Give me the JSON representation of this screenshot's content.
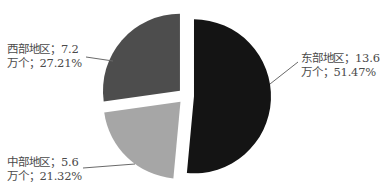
{
  "chart_data": {
    "type": "pie",
    "title": "",
    "exploded": true,
    "start_angle_deg": 0,
    "direction": "clockwise",
    "unit": "万个",
    "slices": [
      {
        "name": "东部地区",
        "value": 13.6,
        "percent": 51.47,
        "color": "#141414",
        "label_line1": "东部地区；13.6",
        "label_line2": "万个；51.47%"
      },
      {
        "name": "中部地区",
        "value": 5.6,
        "percent": 21.32,
        "color": "#a6a6a6",
        "label_line1": "中部地区；5.6",
        "label_line2": "万个；21.32%"
      },
      {
        "name": "西部地区",
        "value": 7.2,
        "percent": 27.21,
        "color": "#4d4d4d",
        "label_line1": "西部地区；7.2",
        "label_line2": "万个；27.21%"
      }
    ],
    "legend": "none",
    "grid": false
  }
}
